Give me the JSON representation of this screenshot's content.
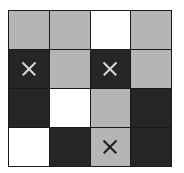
{
  "grid": {
    "rows": 4,
    "cols": 4,
    "colors": {
      "gray": "#b5b5b5",
      "dark": "#262626",
      "white": "#ffffff"
    },
    "cells": [
      [
        {
          "color": "gray",
          "mark": false
        },
        {
          "color": "gray",
          "mark": false
        },
        {
          "color": "white",
          "mark": false
        },
        {
          "color": "gray",
          "mark": false
        }
      ],
      [
        {
          "color": "dark",
          "mark": true
        },
        {
          "color": "gray",
          "mark": false
        },
        {
          "color": "dark",
          "mark": true
        },
        {
          "color": "gray",
          "mark": false
        }
      ],
      [
        {
          "color": "dark",
          "mark": false
        },
        {
          "color": "white",
          "mark": false
        },
        {
          "color": "gray",
          "mark": false
        },
        {
          "color": "dark",
          "mark": false
        }
      ],
      [
        {
          "color": "white",
          "mark": false
        },
        {
          "color": "dark",
          "mark": false
        },
        {
          "color": "gray",
          "mark": true
        },
        {
          "color": "dark",
          "mark": false
        }
      ]
    ]
  }
}
